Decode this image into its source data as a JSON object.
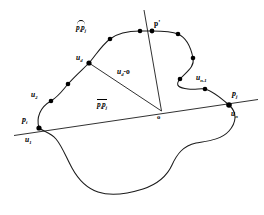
{
  "figure": {
    "type": "geometric-diagram",
    "background_color": "#ffffff",
    "stroke_color": "#1a1a1a",
    "marker_color": "#000000",
    "labels": {
      "arc_pi_pj": "p",
      "arc_pi_pj_sub_i": "i",
      "arc_pi_pj_second": "p",
      "arc_pi_pj_sub_j": "j",
      "chord_pi_pj": "p",
      "chord_pi_pj_sub_i": "i",
      "chord_pi_pj_second": "p",
      "chord_pi_pj_sub_j": "j",
      "p_prime": "p'",
      "u_d": "u",
      "u_d_sub": "d",
      "u_d_to_o": "u",
      "u_d_to_o_sub": "d",
      "u_d_to_o_tail": "-o",
      "u_2": "u",
      "u_2_sub": "2",
      "u_1": "u",
      "u_1_sub": "1",
      "u_n": "u",
      "u_n_sub": "n",
      "u_n_minus_1": "u",
      "u_n_minus_1_sub": "n-1",
      "p_i": "p",
      "p_i_sub": "i",
      "p_j": "p",
      "p_j_sub": "j",
      "origin": "o"
    },
    "points": [
      {
        "name": "p_i",
        "x": 39,
        "y": 128,
        "marker": true
      },
      {
        "name": "u_2",
        "x": 51,
        "y": 101,
        "marker": true
      },
      {
        "name": "sample_a",
        "x": 68,
        "y": 84,
        "marker": true
      },
      {
        "name": "u_d",
        "x": 89,
        "y": 63,
        "marker": true
      },
      {
        "name": "sample_b",
        "x": 110,
        "y": 39,
        "marker": true
      },
      {
        "name": "sample_c",
        "x": 140,
        "y": 31,
        "marker": true
      },
      {
        "name": "p_prime",
        "x": 152,
        "y": 31,
        "marker": true
      },
      {
        "name": "sample_d",
        "x": 178,
        "y": 34,
        "marker": true
      },
      {
        "name": "sample_e",
        "x": 193,
        "y": 58,
        "marker": true
      },
      {
        "name": "sample_f",
        "x": 180,
        "y": 79,
        "marker": true
      },
      {
        "name": "u_n_minus_1",
        "x": 205,
        "y": 89,
        "marker": true
      },
      {
        "name": "p_j",
        "x": 229,
        "y": 105,
        "marker": true
      },
      {
        "name": "o",
        "x": 162,
        "y": 111,
        "marker": false
      }
    ],
    "lines": [
      {
        "name": "chord-pi-pj",
        "x1": 14,
        "y1": 135,
        "x2": 258,
        "y2": 99
      },
      {
        "name": "ray-o-to-ud",
        "x1": 161,
        "y1": 111,
        "x2": 89,
        "y2": 63
      },
      {
        "name": "ray-o-to-pprime",
        "x1": 161,
        "y1": 111,
        "x2": 144,
        "y2": 10
      }
    ]
  }
}
